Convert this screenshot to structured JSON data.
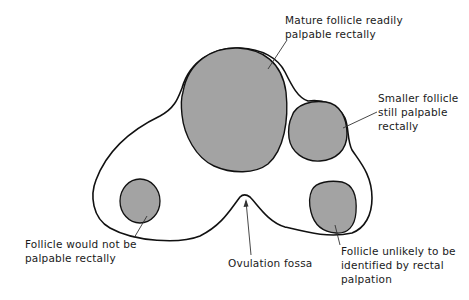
{
  "diagram": {
    "colors": {
      "outline": "#111111",
      "follicle_fill": "#a3a3a3",
      "background": "#ffffff",
      "text": "#1a1a1a"
    },
    "labels": {
      "mature_follicle": {
        "line1": "Mature follicle readily",
        "line2": "palpable rectally"
      },
      "smaller_follicle": {
        "line1": "Smaller follicle",
        "line2": "still palpable",
        "line3": "rectally"
      },
      "left_follicle": {
        "line1": "Follicle would not be",
        "line2": "palpable rectally"
      },
      "ovulation_fossa": {
        "line1": "Ovulation fossa"
      },
      "bottom_right_follicle": {
        "line1": "Follicle unlikely to be",
        "line2": "identified by rectal",
        "line3": "palpation"
      }
    },
    "elements": [
      {
        "name": "ovary-outline",
        "type": "outline"
      },
      {
        "name": "mature-follicle",
        "type": "follicle",
        "palpable": "readily"
      },
      {
        "name": "smaller-follicle",
        "type": "follicle",
        "palpable": "still"
      },
      {
        "name": "left-follicle",
        "type": "follicle",
        "palpable": "no"
      },
      {
        "name": "bottom-right-follicle",
        "type": "follicle",
        "palpable": "unlikely"
      },
      {
        "name": "ovulation-fossa",
        "type": "landmark"
      }
    ]
  }
}
